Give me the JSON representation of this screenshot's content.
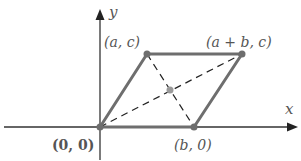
{
  "diagram": {
    "axes": {
      "x_label": "x",
      "y_label": "y"
    },
    "vertices": [
      {
        "id": "origin",
        "label": "(0, 0)",
        "px": [
          100,
          127
        ]
      },
      {
        "id": "b0",
        "label": "(b, 0)",
        "px": [
          194,
          127
        ]
      },
      {
        "id": "ac",
        "label": "(a, c)",
        "px": [
          147,
          54
        ]
      },
      {
        "id": "abc",
        "label": "(a + b, c)",
        "px": [
          242,
          54
        ]
      }
    ],
    "midpoint": {
      "px": [
        170,
        90
      ]
    },
    "colors": {
      "axis": "#333333",
      "edge": "#6e6e6e",
      "diagonal": "#222222",
      "point": "#6e6e6e",
      "midpoint": "#9a9a9a",
      "label": "#555555"
    }
  }
}
